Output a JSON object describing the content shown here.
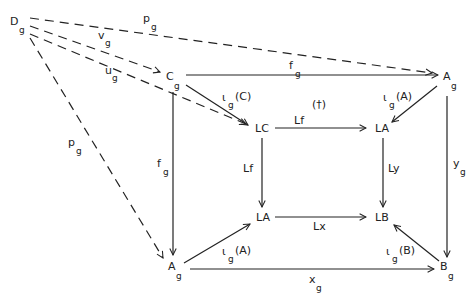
{
  "diagram": {
    "type": "commutative-diagram",
    "nodes": {
      "Dg": {
        "base": "D",
        "sub": "g"
      },
      "Cg": {
        "base": "C",
        "sub": "g"
      },
      "Ag_top": {
        "base": "A",
        "sub": "g"
      },
      "LC": {
        "base": "LC",
        "sub": ""
      },
      "LA_top": {
        "base": "LA",
        "sub": ""
      },
      "LA_bottom": {
        "base": "LA",
        "sub": ""
      },
      "LB": {
        "base": "LB",
        "sub": ""
      },
      "Ag_bottom": {
        "base": "A",
        "sub": "g"
      },
      "Bg": {
        "base": "B",
        "sub": "g"
      }
    },
    "edges": {
      "pg_top": {
        "base": "p",
        "sub": "g",
        "from": "Dg",
        "to": "Ag_top",
        "style": "dashed"
      },
      "vg": {
        "base": "v",
        "sub": "g",
        "from": "Dg",
        "to": "Cg",
        "style": "dashed"
      },
      "ug": {
        "base": "u",
        "sub": "g",
        "from": "Dg",
        "to": "LC",
        "style": "dashed"
      },
      "pg_left": {
        "base": "p",
        "sub": "g",
        "from": "Dg",
        "to": "Ag_bottom",
        "style": "dashed"
      },
      "fg_top": {
        "base": "f",
        "sub": "g",
        "from": "Cg",
        "to": "Ag_top",
        "style": "solid"
      },
      "fg_left": {
        "base": "f",
        "sub": "g",
        "from": "Cg",
        "to": "Ag_bottom",
        "style": "solid"
      },
      "iota_C": {
        "base": "ι",
        "sub": "g",
        "arg": "(C)",
        "from": "Cg",
        "to": "LC",
        "style": "solid"
      },
      "iota_A_top": {
        "base": "ι",
        "sub": "g",
        "arg": "(A)",
        "from": "Ag_top",
        "to": "LA_top",
        "style": "solid"
      },
      "Lf_top": {
        "base": "Lf",
        "from": "LC",
        "to": "LA_top",
        "style": "solid"
      },
      "Lf_left": {
        "base": "Lf",
        "from": "LC",
        "to": "LA_bottom",
        "style": "solid"
      },
      "Ly": {
        "base": "Ly",
        "from": "LA_top",
        "to": "LB",
        "style": "solid"
      },
      "Lx": {
        "base": "Lx",
        "from": "LA_bottom",
        "to": "LB",
        "style": "solid"
      },
      "yg": {
        "base": "y",
        "sub": "g",
        "from": "Ag_top",
        "to": "Bg",
        "style": "solid"
      },
      "iota_A_bottom": {
        "base": "ι",
        "sub": "g",
        "arg": "(A)",
        "from": "Ag_bottom",
        "to": "LA_bottom",
        "style": "solid"
      },
      "iota_B": {
        "base": "ι",
        "sub": "g",
        "arg": "(B)",
        "from": "Bg",
        "to": "LB",
        "style": "solid"
      },
      "xg": {
        "base": "x",
        "sub": "g",
        "from": "Ag_bottom",
        "to": "Bg",
        "style": "solid"
      }
    },
    "annotations": {
      "dagger": "(†)"
    }
  }
}
